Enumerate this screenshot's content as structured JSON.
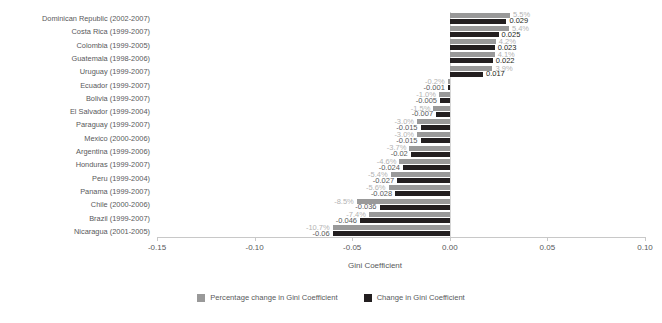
{
  "chart_data": {
    "type": "bar",
    "title": "",
    "xlabel": "Gini Coefficient",
    "ylabel": "",
    "orientation": "horizontal",
    "xlim": [
      -0.15,
      0.1
    ],
    "xticks": [
      -0.15,
      -0.1,
      -0.05,
      0.0,
      0.05,
      0.1
    ],
    "xtick_labels": [
      "-0.15",
      "-0.10",
      "-0.05",
      "0.00",
      "0.05",
      "0.10"
    ],
    "grid": false,
    "legend_position": "bottom",
    "categories": [
      "Dominican Republic (2002-2007)",
      "Costa Rica (1999-2007)",
      "Colombia (1999-2005)",
      "Guatemala (1998-2006)",
      "Uruguay (1999-2007)",
      "Ecuador (1999-2007)",
      "Bolivia (1999-2007)",
      "El Salvador (1999-2004)",
      "Paraguay (1999-2007)",
      "Mexico (2000-2006)",
      "Argentina (1999-2006)",
      "Honduras (1999-2007)",
      "Peru (1999-2004)",
      "Panama (1999-2007)",
      "Chile (2000-2006)",
      "Brazil (1999-2007)",
      "Nicaragua (2001-2005)"
    ],
    "series": [
      {
        "name": "Percentage change in Gini Coefficient",
        "color": "#999999",
        "unit": "%",
        "values": [
          5.5,
          5.4,
          4.2,
          4.1,
          3.9,
          -0.2,
          -1.0,
          -1.5,
          -3.0,
          -3.0,
          -3.7,
          -4.6,
          -5.4,
          -5.6,
          -8.5,
          -7.4,
          -10.7
        ],
        "labels": [
          "5.5%",
          "5.4%",
          "4.2%",
          "4.1%",
          "3.9%",
          "-0.2%",
          "-1.0%",
          "-1.5%",
          "-3.0%",
          "-3.0%",
          "-3.7%",
          "-4.6%",
          "-5.4%",
          "-5.6%",
          "-8.5%",
          "-7.4%",
          "-10.7%"
        ]
      },
      {
        "name": "Change in Gini Coefficient",
        "color": "#231f20",
        "unit": "",
        "values": [
          0.029,
          0.025,
          0.023,
          0.022,
          0.017,
          -0.001,
          -0.005,
          -0.007,
          -0.015,
          -0.015,
          -0.02,
          -0.024,
          -0.027,
          -0.028,
          -0.036,
          -0.046,
          -0.06
        ],
        "labels": [
          "0.029",
          "0.025",
          "0.023",
          "0.022",
          "0.017",
          "-0.001",
          "-0.005",
          "-0.007",
          "-0.015",
          "-0.015",
          "-0.02",
          "-0.024",
          "-0.027",
          "-0.028",
          "-0.036",
          "-0.046",
          "-0.06"
        ]
      }
    ]
  },
  "legend": {
    "items": [
      {
        "label": "Percentage change in Gini Coefficient",
        "color": "#999999"
      },
      {
        "label": "Change in Gini Coefficient",
        "color": "#231f20"
      }
    ]
  }
}
